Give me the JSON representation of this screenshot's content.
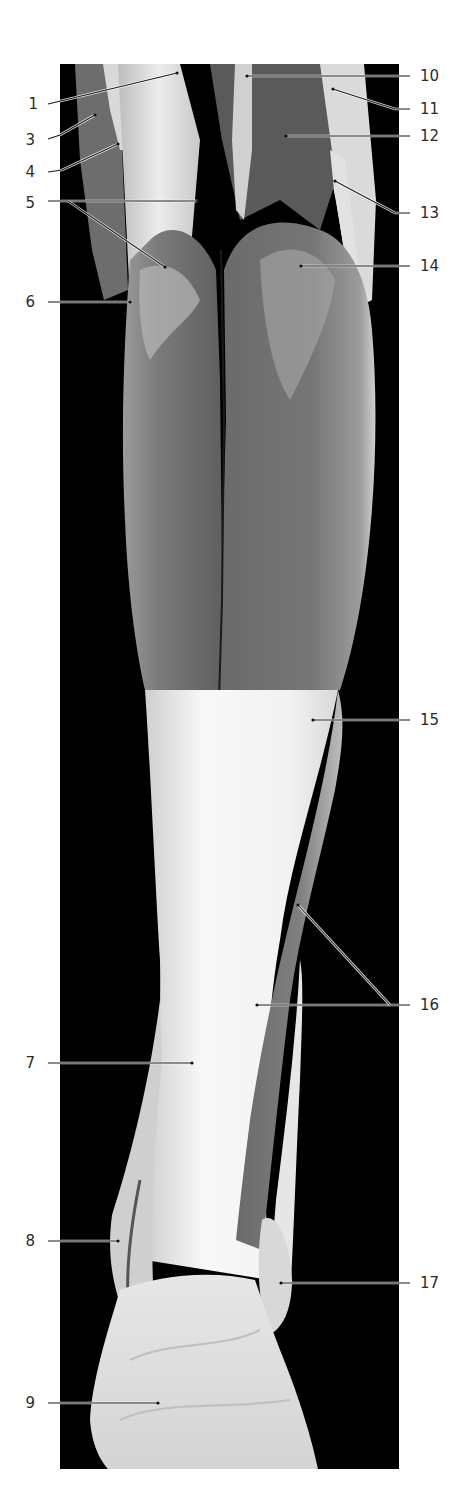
{
  "figure": {
    "type": "anatomical-photograph",
    "view": "posterior lower leg dissection",
    "photo_frame": {
      "x": 60,
      "y": 64,
      "width": 339,
      "height": 1405
    },
    "colors": {
      "background": "#000000",
      "page": "#ffffff",
      "muscle": "#6e6e6e",
      "muscle_light": "#8c8c8c",
      "tendon": "#e8e8e8",
      "tendon_bright": "#f7f7f7",
      "label_text": "#2b2b2b",
      "leader_line": "#1a1a1a"
    }
  },
  "labels": [
    {
      "id": "1",
      "text": "1",
      "side": "left",
      "tx": 38,
      "ty": 109,
      "points": [
        [
          48,
          104
        ],
        [
          177,
          73
        ]
      ]
    },
    {
      "id": "3",
      "text": "3",
      "side": "left",
      "tx": 35,
      "ty": 145,
      "points": [
        [
          48,
          139
        ],
        [
          60,
          135
        ],
        [
          95,
          115
        ]
      ]
    },
    {
      "id": "4",
      "text": "4",
      "side": "left",
      "tx": 35,
      "ty": 177,
      "points": [
        [
          48,
          172
        ],
        [
          62,
          170
        ],
        [
          118,
          144
        ]
      ]
    },
    {
      "id": "5",
      "text": "5",
      "side": "left",
      "tx": 35,
      "ty": 208,
      "points": [
        [
          48,
          201
        ],
        [
          198,
          201
        ]
      ],
      "extra": [
        [
          68,
          201
        ],
        [
          165,
          267
        ]
      ]
    },
    {
      "id": "6",
      "text": "6",
      "side": "left",
      "tx": 35,
      "ty": 307,
      "points": [
        [
          48,
          302
        ],
        [
          130,
          302
        ]
      ]
    },
    {
      "id": "7",
      "text": "7",
      "side": "left",
      "tx": 35,
      "ty": 1068,
      "points": [
        [
          48,
          1063
        ],
        [
          192,
          1063
        ]
      ]
    },
    {
      "id": "8",
      "text": "8",
      "side": "left",
      "tx": 35,
      "ty": 1246,
      "points": [
        [
          48,
          1241
        ],
        [
          118,
          1241
        ]
      ]
    },
    {
      "id": "9",
      "text": "9",
      "side": "left",
      "tx": 35,
      "ty": 1408,
      "points": [
        [
          48,
          1403
        ],
        [
          158,
          1403
        ]
      ]
    },
    {
      "id": "10",
      "text": "10",
      "side": "right",
      "tx": 420,
      "ty": 81,
      "points": [
        [
          410,
          76
        ],
        [
          247,
          76
        ]
      ]
    },
    {
      "id": "11",
      "text": "11",
      "side": "right",
      "tx": 420,
      "ty": 114,
      "points": [
        [
          410,
          109
        ],
        [
          395,
          109
        ],
        [
          333,
          89
        ]
      ]
    },
    {
      "id": "12",
      "text": "12",
      "side": "right",
      "tx": 420,
      "ty": 141,
      "points": [
        [
          410,
          136
        ],
        [
          286,
          136
        ]
      ]
    },
    {
      "id": "13",
      "text": "13",
      "side": "right",
      "tx": 420,
      "ty": 218,
      "points": [
        [
          410,
          213
        ],
        [
          395,
          213
        ],
        [
          335,
          181
        ]
      ]
    },
    {
      "id": "14",
      "text": "14",
      "side": "right",
      "tx": 420,
      "ty": 271,
      "points": [
        [
          410,
          266
        ],
        [
          301,
          266
        ]
      ]
    },
    {
      "id": "15",
      "text": "15",
      "side": "right",
      "tx": 420,
      "ty": 725,
      "points": [
        [
          410,
          720
        ],
        [
          313,
          720
        ]
      ]
    },
    {
      "id": "16",
      "text": "16",
      "side": "right",
      "tx": 420,
      "ty": 1010,
      "points": [
        [
          410,
          1005
        ],
        [
          257,
          1005
        ]
      ],
      "extra": [
        [
          390,
          1005
        ],
        [
          298,
          905
        ]
      ]
    },
    {
      "id": "17",
      "text": "17",
      "side": "right",
      "tx": 420,
      "ty": 1288,
      "points": [
        [
          410,
          1283
        ],
        [
          281,
          1283
        ]
      ]
    }
  ]
}
